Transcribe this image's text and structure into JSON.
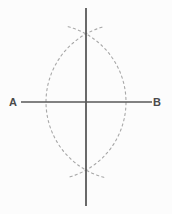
{
  "figure": {
    "background_color": "#fcfcfc",
    "width": 172,
    "height": 214,
    "solid_line_color": "#595959",
    "dashed_arc_color": "#a8a8a8",
    "label_color": "#4a4a4a"
  },
  "labels": {
    "endpoint_a": "A",
    "endpoint_b": "B"
  },
  "chart_data": {
    "type": "diagram",
    "elements": [
      {
        "name": "segment-ab",
        "kind": "line",
        "style": "solid",
        "x1": 21,
        "y1": 102,
        "x2": 152,
        "y2": 102,
        "color": "#595959",
        "width": 1.6
      },
      {
        "name": "perpendicular-bisector",
        "kind": "line",
        "style": "solid",
        "x1": 86,
        "y1": 8,
        "x2": 86,
        "y2": 206,
        "color": "#595959",
        "width": 1.8
      },
      {
        "name": "arc-from-a",
        "kind": "arc",
        "style": "dashed",
        "center_x": 48,
        "center_y": 102,
        "radius": 78,
        "start_angle_deg": -75,
        "end_angle_deg": 75,
        "color": "#a8a8a8",
        "width": 1.1,
        "dash": "2.2 3.2"
      },
      {
        "name": "arc-from-b",
        "kind": "arc",
        "style": "dashed",
        "center_x": 124,
        "center_y": 102,
        "radius": 78,
        "start_angle_deg": 105,
        "end_angle_deg": 255,
        "color": "#a8a8a8",
        "width": 1.1,
        "dash": "2.2 3.2"
      }
    ],
    "points": [
      {
        "name": "A",
        "label": "A",
        "x": 13,
        "y": 102
      },
      {
        "name": "B",
        "label": "B",
        "x": 157,
        "y": 102
      },
      {
        "name": "upper-intersection",
        "label": "",
        "x": 86,
        "y": 17
      },
      {
        "name": "lower-intersection",
        "label": "",
        "x": 86,
        "y": 188
      },
      {
        "name": "midpoint",
        "label": "",
        "x": 86,
        "y": 102
      }
    ]
  }
}
